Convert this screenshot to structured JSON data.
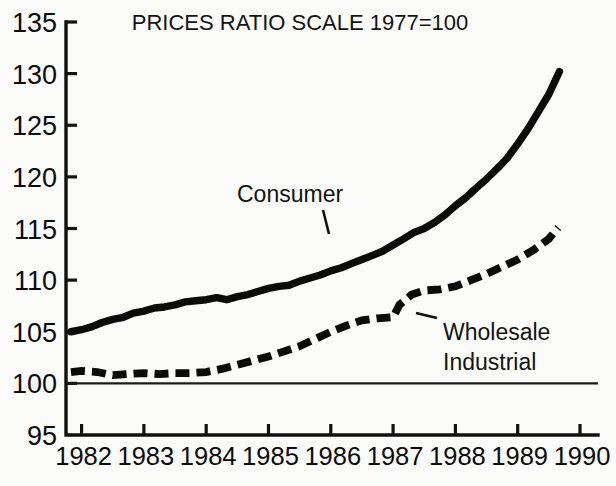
{
  "chart_data": {
    "type": "line",
    "title": "PRICES RATIO SCALE 1977=100",
    "xlabel": "",
    "ylabel": "",
    "xlim": [
      1981.75,
      1990.0
    ],
    "ylim": [
      95,
      135
    ],
    "yticks": [
      95,
      100,
      105,
      110,
      115,
      120,
      125,
      130,
      135
    ],
    "ytick_labels": [
      "95",
      "100",
      "105",
      "110",
      "115",
      "120",
      "125",
      "130",
      "135"
    ],
    "xticks": [
      1982,
      1983,
      1984,
      1985,
      1986,
      1987,
      1988,
      1989,
      1990
    ],
    "xtick_labels": [
      "1982",
      "1983",
      "1984",
      "1985",
      "1986",
      "1987",
      "1988",
      "1989",
      "1990"
    ],
    "grid": false,
    "legend": "inline-annotations",
    "reference_line": 100,
    "series": [
      {
        "name": "Consumer",
        "style": "solid",
        "label_position": "inline",
        "x": [
          1981.83,
          1982.0,
          1982.17,
          1982.33,
          1982.5,
          1982.67,
          1982.83,
          1983.0,
          1983.17,
          1983.33,
          1983.5,
          1983.67,
          1983.83,
          1984.0,
          1984.17,
          1984.33,
          1984.5,
          1984.67,
          1984.83,
          1985.0,
          1985.17,
          1985.33,
          1985.5,
          1985.67,
          1985.83,
          1986.0,
          1986.17,
          1986.33,
          1986.5,
          1986.67,
          1986.83,
          1987.0,
          1987.17,
          1987.33,
          1987.5,
          1987.67,
          1987.83,
          1988.0,
          1988.17,
          1988.33,
          1988.5,
          1988.67,
          1988.83,
          1989.0,
          1989.17,
          1989.33,
          1989.5,
          1989.67
        ],
        "y": [
          105.0,
          105.2,
          105.5,
          105.9,
          106.2,
          106.4,
          106.8,
          107.0,
          107.3,
          107.4,
          107.6,
          107.9,
          108.0,
          108.1,
          108.3,
          108.1,
          108.4,
          108.6,
          108.9,
          109.2,
          109.4,
          109.5,
          109.9,
          110.2,
          110.5,
          110.9,
          111.2,
          111.6,
          112.0,
          112.4,
          112.8,
          113.4,
          114.0,
          114.6,
          115.0,
          115.6,
          116.3,
          117.2,
          118.0,
          118.9,
          119.8,
          120.8,
          121.8,
          123.2,
          124.7,
          126.3,
          128.0,
          130.2
        ]
      },
      {
        "name": "Wholesale Industrial",
        "style": "dashed",
        "label_position": "inline",
        "x": [
          1981.83,
          1982.0,
          1982.25,
          1982.5,
          1982.75,
          1983.0,
          1983.25,
          1983.5,
          1983.75,
          1984.0,
          1984.25,
          1984.5,
          1984.75,
          1985.0,
          1985.25,
          1985.5,
          1985.75,
          1986.0,
          1986.25,
          1986.5,
          1986.75,
          1987.0,
          1987.1,
          1987.3,
          1987.5,
          1987.75,
          1988.0,
          1988.25,
          1988.5,
          1988.75,
          1989.0,
          1989.25,
          1989.5,
          1989.65
        ],
        "y": [
          101.1,
          101.2,
          101.1,
          100.8,
          100.9,
          101.0,
          100.9,
          101.0,
          101.0,
          101.1,
          101.4,
          101.8,
          102.2,
          102.6,
          103.1,
          103.6,
          104.3,
          105.0,
          105.6,
          106.1,
          106.3,
          106.4,
          107.6,
          108.6,
          109.0,
          109.1,
          109.4,
          110.0,
          110.6,
          111.3,
          112.0,
          112.9,
          114.0,
          115.1
        ]
      }
    ],
    "annotations": [
      {
        "text": "Consumer",
        "x_px": 237,
        "y_px": 202,
        "leader_to_x_px": 329,
        "leader_to_y_px": 234
      },
      {
        "text": "Wholesale",
        "x_px": 443,
        "y_px": 340,
        "leader_to_x_px": 416,
        "leader_to_y_px": 313
      },
      {
        "text": "Industrial",
        "x_px": 443,
        "y_px": 370,
        "leader_to_x_px": null,
        "leader_to_y_px": null
      }
    ]
  }
}
